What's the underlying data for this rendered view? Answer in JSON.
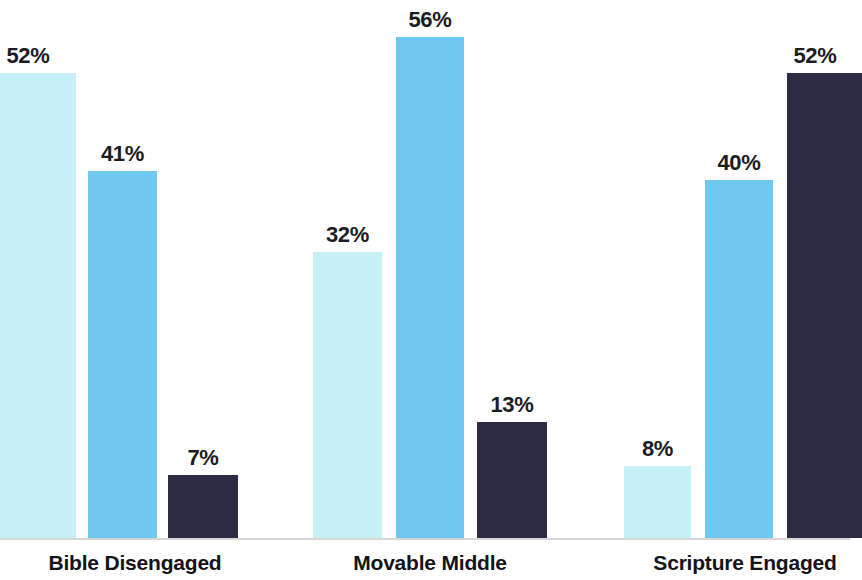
{
  "chart_data": {
    "type": "bar",
    "title": "",
    "subtitle": "",
    "xlabel": "",
    "ylabel": "",
    "ylim": [
      0,
      60
    ],
    "grid": false,
    "legend_position": "none",
    "categories": [
      "Bible Disengaged",
      "Movable Middle",
      "Scripture Engaged"
    ],
    "series": [
      {
        "name": "Series 1",
        "color": "#c8f0f7",
        "values": [
          52,
          32,
          8
        ],
        "labels": [
          "52%",
          "32%",
          "8%"
        ]
      },
      {
        "name": "Series 2",
        "color": "#6ec8f0",
        "values": [
          41,
          56,
          40
        ],
        "labels": [
          "41%",
          "56%",
          "40%"
        ]
      },
      {
        "name": "Series 3",
        "color": "#2b2b44",
        "values": [
          7,
          13,
          52
        ],
        "labels": [
          "7%",
          "13%",
          "52%"
        ]
      }
    ],
    "bars": [
      {
        "group": "Bible Disengaged",
        "series": "Series 1",
        "value": 52,
        "label": "52%",
        "color": "#c8f0f7",
        "x": -6,
        "width": 82,
        "clipped": "left"
      },
      {
        "group": "Bible Disengaged",
        "series": "Series 2",
        "value": 41,
        "label": "41%",
        "color": "#6ec8f0",
        "x": 88,
        "width": 69,
        "clipped": "none"
      },
      {
        "group": "Bible Disengaged",
        "series": "Series 3",
        "value": 7,
        "label": "7%",
        "color": "#2b2b44",
        "x": 168,
        "width": 70,
        "clipped": "none"
      },
      {
        "group": "Movable Middle",
        "series": "Series 1",
        "value": 32,
        "label": "32%",
        "color": "#c8f0f7",
        "x": 313,
        "width": 69,
        "clipped": "none"
      },
      {
        "group": "Movable Middle",
        "series": "Series 2",
        "value": 56,
        "label": "56%",
        "color": "#6ec8f0",
        "x": 396,
        "width": 68,
        "clipped": "none"
      },
      {
        "group": "Movable Middle",
        "series": "Series 3",
        "value": 13,
        "label": "13%",
        "color": "#2b2b44",
        "x": 477,
        "width": 70,
        "clipped": "none"
      },
      {
        "group": "Scripture Engaged",
        "series": "Series 1",
        "value": 8,
        "label": "8%",
        "color": "#c8f0f7",
        "x": 624,
        "width": 67,
        "clipped": "none"
      },
      {
        "group": "Scripture Engaged",
        "series": "Series 2",
        "value": 40,
        "label": "40%",
        "color": "#6ec8f0",
        "x": 705,
        "width": 68,
        "clipped": "none"
      },
      {
        "group": "Scripture Engaged",
        "series": "Series 3",
        "value": 52,
        "label": "52%",
        "color": "#2b2b44",
        "x": 787,
        "width": 75,
        "clipped": "right"
      }
    ],
    "group_label_centers": [
      135,
      430,
      745
    ],
    "baseline_y": 538,
    "px_per_unit": 8.94,
    "colors": {
      "light_blue": "#c8f0f7",
      "medium_blue": "#6ec8f0",
      "dark_navy": "#2b2b44",
      "label_text": "#1c1c22",
      "background": "#ffffff",
      "baseline": "#c9c9c9"
    }
  }
}
